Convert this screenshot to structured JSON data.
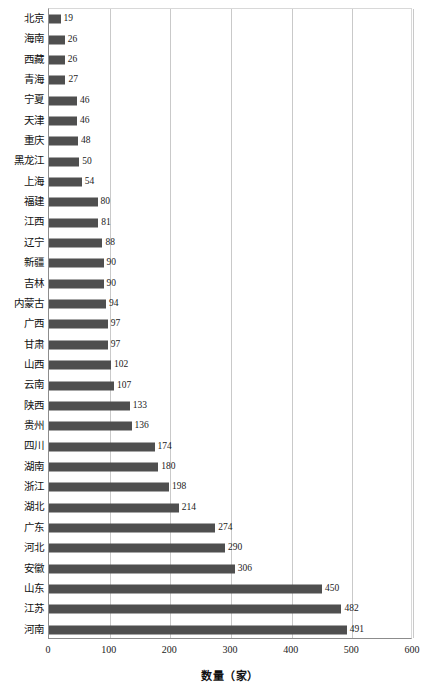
{
  "chart_data": {
    "type": "bar",
    "orientation": "horizontal",
    "title": "",
    "xlabel": "数量（家）",
    "ylabel": "",
    "xlim": [
      0,
      600
    ],
    "xticks": [
      0,
      100,
      200,
      300,
      400,
      500,
      600
    ],
    "xtick_labels": [
      "0",
      "100",
      "200",
      "300",
      "400",
      "500",
      "600"
    ],
    "grid": "vertical",
    "legend": null,
    "bar_color": "#4f4f4f",
    "categories": [
      "北京",
      "海南",
      "西藏",
      "青海",
      "宁夏",
      "天津",
      "重庆",
      "黑龙江",
      "上海",
      "福建",
      "江西",
      "辽宁",
      "新疆",
      "吉林",
      "内蒙古",
      "广西",
      "甘肃",
      "山西",
      "云南",
      "陕西",
      "贵州",
      "四川",
      "湖南",
      "浙江",
      "湖北",
      "广东",
      "河北",
      "安徽",
      "山东",
      "江苏",
      "河南"
    ],
    "values": [
      19,
      26,
      26,
      27,
      46,
      46,
      48,
      50,
      54,
      80,
      81,
      88,
      90,
      90,
      94,
      97,
      97,
      102,
      107,
      133,
      136,
      174,
      180,
      198,
      214,
      274,
      290,
      306,
      450,
      482,
      491
    ],
    "data_labels": [
      "19",
      "26",
      "26",
      "27",
      "46",
      "46",
      "48",
      "50",
      "54",
      "80",
      "81",
      "88",
      "90",
      "90",
      "94",
      "97",
      "97",
      "102",
      "107",
      "133",
      "136",
      "174",
      "180",
      "198",
      "214",
      "274",
      "290",
      "306",
      "450",
      "482",
      "491"
    ]
  }
}
